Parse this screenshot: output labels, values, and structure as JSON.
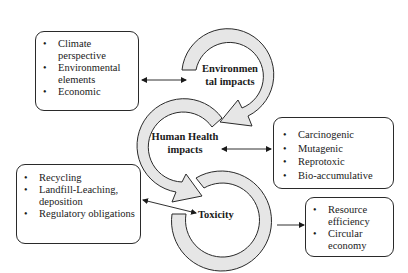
{
  "diagram": {
    "cycle_nodes": [
      {
        "id": "environmental",
        "label_line1": "Environmen",
        "label_line2": "tal impacts"
      },
      {
        "id": "human_health",
        "label_line1": "Human Health",
        "label_line2": "impacts"
      },
      {
        "id": "toxicity",
        "label_line1": "Toxicity"
      }
    ],
    "boxes": {
      "environmental_factors": {
        "items": [
          "Climate perspective",
          "Environmental elements",
          "Economic"
        ]
      },
      "health_effects": {
        "items": [
          "Carcinogenic",
          "Mutagenic",
          "Reprotoxic",
          "Bio-accumulative"
        ]
      },
      "waste_management": {
        "items": [
          "Recycling",
          "Landfill-Leaching, deposition",
          "Regulatory obligations"
        ]
      },
      "outcomes": {
        "items": [
          "Resource efficiency",
          "Circular economy"
        ]
      }
    },
    "connections": [
      {
        "from": "environmental_factors",
        "to": "environmental",
        "type": "bidirectional"
      },
      {
        "from": "human_health",
        "to": "health_effects",
        "type": "bidirectional"
      },
      {
        "from": "waste_management",
        "to": "toxicity",
        "type": "bidirectional"
      },
      {
        "from": "toxicity",
        "to": "outcomes",
        "type": "directional"
      }
    ],
    "colors": {
      "ring_fill": "#e6e6e6",
      "stroke": "#2a2a2a"
    }
  }
}
